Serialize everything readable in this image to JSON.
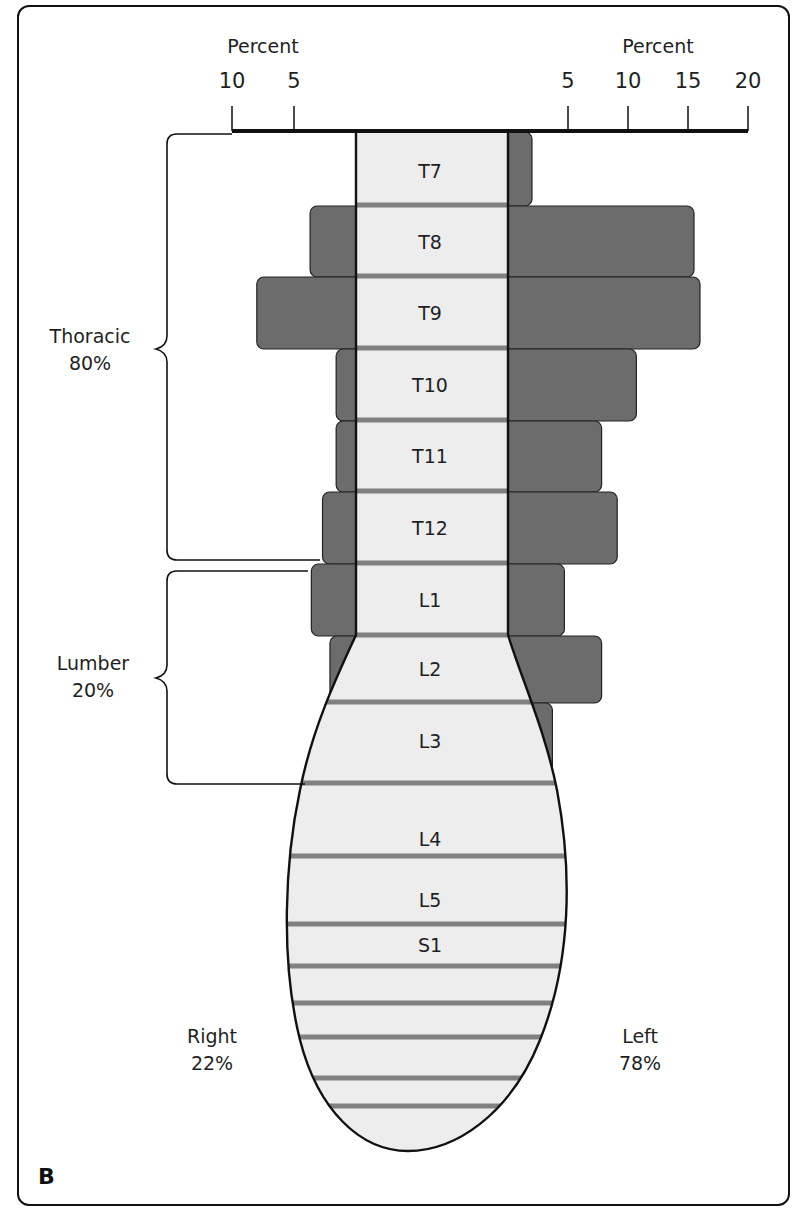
{
  "panel_label": "B",
  "chart_data": {
    "type": "bar",
    "subtype": "butterfly-diverging",
    "title": "",
    "axis": {
      "left": {
        "label": "Percent",
        "ticks": [
          10,
          5
        ],
        "tick_labels": [
          "10",
          "5"
        ],
        "range": [
          0,
          10
        ]
      },
      "right": {
        "label": "Percent",
        "ticks": [
          5,
          10,
          15,
          20
        ],
        "tick_labels": [
          "5",
          "10",
          "15",
          "20"
        ],
        "range": [
          0,
          20
        ]
      }
    },
    "categories": [
      "T7",
      "T8",
      "T9",
      "T10",
      "T11",
      "T12",
      "L1",
      "L2",
      "L3",
      "L4",
      "L5",
      "S1"
    ],
    "series": [
      {
        "name": "Right",
        "side": "left",
        "values": [
          0,
          3.7,
          8.0,
          1.6,
          1.6,
          2.7,
          3.6,
          2.1,
          0,
          0,
          0,
          0
        ]
      },
      {
        "name": "Left",
        "side": "right",
        "values": [
          2.0,
          15.5,
          16.0,
          10.7,
          7.8,
          9.1,
          4.7,
          7.8,
          3.7,
          0,
          0,
          0
        ]
      }
    ],
    "groups": [
      {
        "name": "Thoracic",
        "percent": "80%",
        "members": [
          "T7",
          "T8",
          "T9",
          "T10",
          "T11",
          "T12"
        ]
      },
      {
        "name": "Lumber",
        "percent": "20%",
        "members": [
          "L1",
          "L2",
          "L3"
        ]
      }
    ],
    "side_totals": [
      {
        "name": "Right",
        "percent": "22%"
      },
      {
        "name": "Left",
        "percent": "78%"
      }
    ],
    "legend": null,
    "grid": false
  },
  "colors": {
    "bar": "#6c6c6c",
    "column": "#ededed",
    "separator": "#808080",
    "outline": "#111111"
  },
  "labels": {
    "axis_left_title": "Percent",
    "axis_right_title": "Percent",
    "group_thoracic_name": "Thoracic",
    "group_thoracic_pct": "80%",
    "group_lumber_name": "Lumber",
    "group_lumber_pct": "20%",
    "side_right_name": "Right",
    "side_right_pct": "22%",
    "side_left_name": "Left",
    "side_left_pct": "78%"
  }
}
